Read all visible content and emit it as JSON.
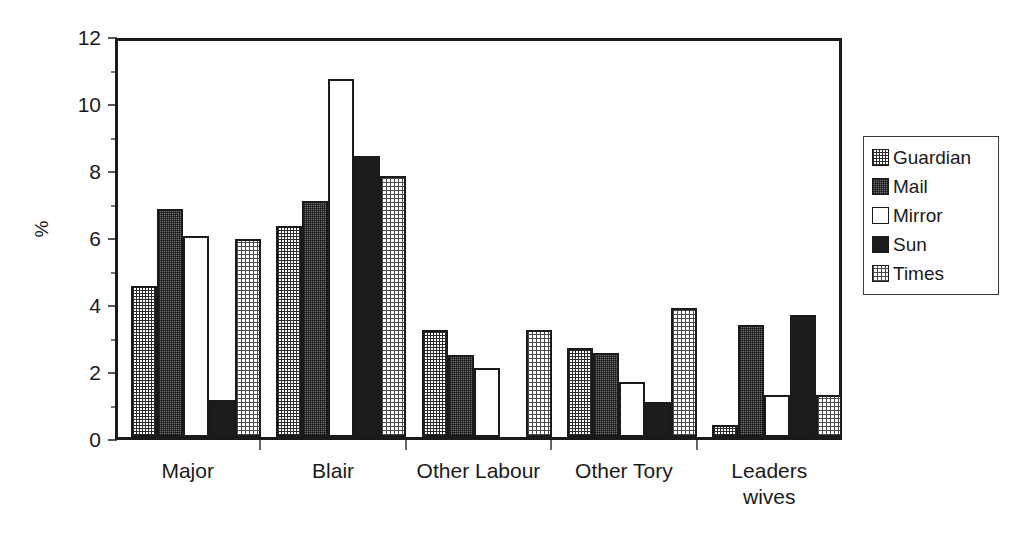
{
  "chart_data": {
    "type": "bar",
    "title": "",
    "subtitle": "",
    "xlabel": "",
    "ylabel": "%",
    "ylim": [
      0,
      12
    ],
    "yticks": [
      0,
      2,
      4,
      6,
      8,
      10,
      12
    ],
    "ytick_labels": [
      "0",
      "2",
      "4",
      "6",
      "8",
      "10",
      "12"
    ],
    "grid": false,
    "legend_position": "right",
    "categories": [
      "Major",
      "Blair",
      "Other Labour",
      "Other Tory",
      "Leaders\nwives"
    ],
    "series": [
      {
        "name": "Guardian",
        "pattern": "fine-crosshatch",
        "color": "#ffffff",
        "values": [
          4.5,
          6.3,
          3.2,
          2.65,
          0.35
        ]
      },
      {
        "name": "Mail",
        "pattern": "dense-checker",
        "color": "#6e6e6e",
        "values": [
          6.8,
          7.05,
          2.45,
          2.5,
          3.35
        ]
      },
      {
        "name": "Mirror",
        "pattern": "solid-white",
        "color": "#ffffff",
        "values": [
          6.0,
          10.7,
          2.05,
          1.65,
          1.25
        ]
      },
      {
        "name": "Sun",
        "pattern": "solid-black",
        "color": "#1c1c1c",
        "values": [
          1.1,
          8.4,
          0.0,
          1.05,
          3.65
        ]
      },
      {
        "name": "Times",
        "pattern": "coarse-crosshatch",
        "color": "#ffffff",
        "values": [
          5.9,
          7.8,
          3.2,
          3.85,
          1.25
        ]
      }
    ]
  },
  "legend": {
    "entries": [
      {
        "label": "Guardian"
      },
      {
        "label": "Mail"
      },
      {
        "label": "Mirror"
      },
      {
        "label": "Sun"
      },
      {
        "label": "Times"
      }
    ]
  },
  "axes": {
    "y_title": "%",
    "y_tick_labels": [
      "12",
      "10",
      "8",
      "6",
      "4",
      "2",
      "0"
    ],
    "x_tick_labels": [
      "Major",
      "Blair",
      "Other Labour",
      "Other Tory",
      "Leaders\nwives"
    ]
  },
  "colors": {
    "axis": "#1a1a1a",
    "background": "#ffffff",
    "series_mail": "#6e6e6e",
    "series_sun": "#1c1c1c"
  }
}
